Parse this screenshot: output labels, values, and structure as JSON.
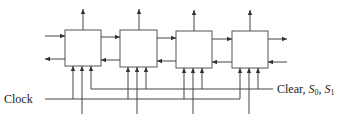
{
  "diagram": {
    "type": "block-diagram",
    "cells": [
      {
        "id": "cell-1",
        "x": 65,
        "y": 30,
        "w": 36,
        "h": 36
      },
      {
        "id": "cell-2",
        "x": 120,
        "y": 30,
        "w": 37,
        "h": 37
      },
      {
        "id": "cell-3",
        "x": 176,
        "y": 31,
        "w": 36,
        "h": 37
      },
      {
        "id": "cell-4",
        "x": 232,
        "y": 31,
        "w": 36,
        "h": 37
      }
    ],
    "labels": {
      "clock": "Clock",
      "control": "Clear, ",
      "s0_base": "S",
      "s0_sub": "0",
      "sep": ", ",
      "s1_base": "S",
      "s1_sub": "1"
    },
    "colors": {
      "line": "#444444",
      "box": "#555555",
      "text": "#222222",
      "background": "#ffffff"
    }
  }
}
